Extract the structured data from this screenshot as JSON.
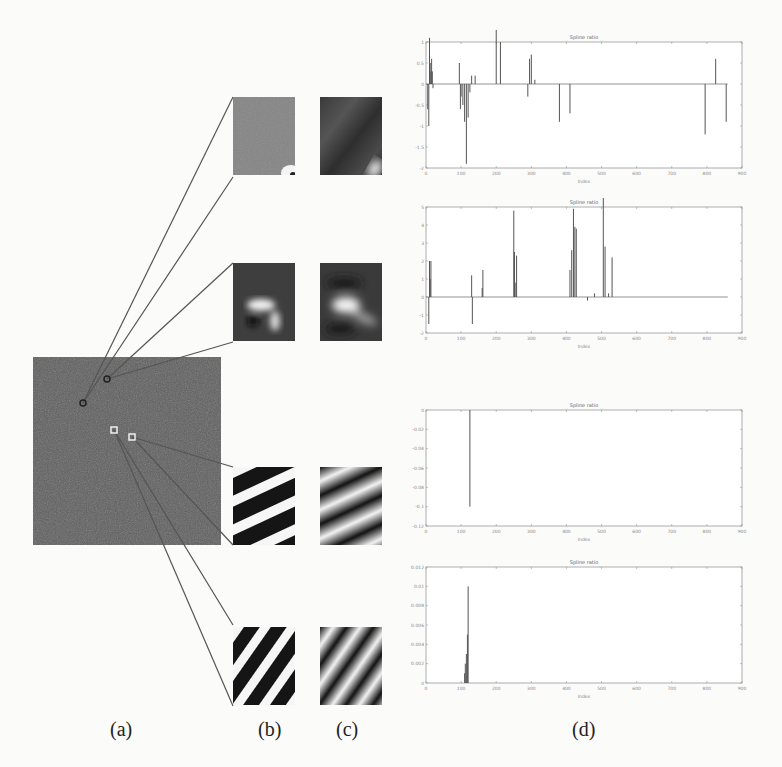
{
  "figure": {
    "panel_labels": {
      "a": "(a)",
      "b": "(b)",
      "c": "(c)",
      "d": "(d)"
    }
  },
  "chart_data": [
    {
      "type": "bar",
      "title": "Spline ratio",
      "xlabel": "Index",
      "ylabel": "Value",
      "y_multiplier": "x 10^-?",
      "xlim": [
        0,
        900
      ],
      "ylim": [
        -2,
        1
      ],
      "xticks": [
        0,
        100,
        200,
        300,
        400,
        500,
        600,
        700,
        800,
        900
      ],
      "yticks": [
        -2,
        -1.5,
        -1,
        -0.5,
        0,
        0.5,
        1
      ],
      "x": [
        5,
        8,
        10,
        12,
        14,
        16,
        18,
        20,
        95,
        98,
        100,
        105,
        110,
        115,
        120,
        125,
        130,
        140,
        200,
        212,
        290,
        295,
        300,
        310,
        380,
        410,
        795,
        825,
        855
      ],
      "values": [
        -0.6,
        -1.0,
        1.1,
        0.5,
        0.3,
        0.6,
        0.3,
        -0.1,
        0.5,
        -0.6,
        -0.3,
        -0.5,
        -0.9,
        -1.9,
        -0.8,
        -0.2,
        0.2,
        0.2,
        1.4,
        1.0,
        -0.3,
        0.6,
        0.7,
        0.1,
        -0.9,
        -0.7,
        -1.2,
        0.6,
        -0.9
      ]
    },
    {
      "type": "bar",
      "title": "Spline ratio",
      "xlabel": "Index",
      "ylabel": "Value",
      "xlim": [
        0,
        900
      ],
      "ylim": [
        -2,
        5
      ],
      "xticks": [
        0,
        100,
        200,
        300,
        400,
        500,
        600,
        700,
        800,
        900
      ],
      "yticks": [
        -2,
        -1,
        0,
        1,
        2,
        3,
        4,
        5
      ],
      "x": [
        8,
        10,
        12,
        14,
        130,
        132,
        160,
        162,
        250,
        252,
        254,
        258,
        410,
        415,
        420,
        424,
        428,
        460,
        480,
        505,
        510,
        520,
        530
      ],
      "values": [
        -1.5,
        2.0,
        1.0,
        2.0,
        1.2,
        -1.5,
        0.5,
        1.5,
        4.8,
        2.5,
        0.8,
        2.3,
        1.5,
        2.6,
        4.9,
        3.9,
        3.8,
        -0.2,
        0.2,
        5.5,
        2.8,
        0.2,
        2.2
      ]
    },
    {
      "type": "bar",
      "title": "Spline ratio",
      "xlabel": "Index",
      "ylabel": "Value",
      "xlim": [
        0,
        900
      ],
      "ylim": [
        -0.12,
        0
      ],
      "xticks": [
        0,
        100,
        200,
        300,
        400,
        500,
        600,
        700,
        800,
        900
      ],
      "yticks": [
        -0.12,
        -0.1,
        -0.08,
        -0.06,
        -0.04,
        -0.02,
        0
      ],
      "x": [
        125
      ],
      "values": [
        -0.1
      ]
    },
    {
      "type": "bar",
      "title": "Spline ratio",
      "xlabel": "Index",
      "ylabel": "Value",
      "xlim": [
        0,
        900
      ],
      "ylim": [
        0,
        0.012
      ],
      "xticks": [
        0,
        100,
        200,
        300,
        400,
        500,
        600,
        700,
        800,
        900
      ],
      "yticks": [
        0,
        0.002,
        0.004,
        0.006,
        0.008,
        0.01,
        0.012
      ],
      "x": [
        110,
        112,
        115,
        118,
        120
      ],
      "values": [
        0.001,
        0.002,
        0.003,
        0.005,
        0.01
      ]
    }
  ]
}
